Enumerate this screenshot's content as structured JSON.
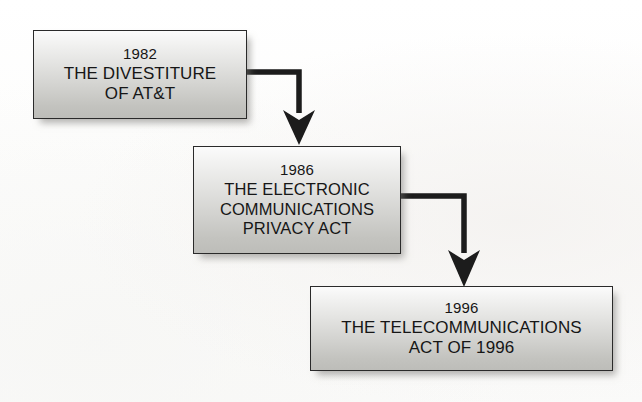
{
  "diagram": {
    "type": "flowchart",
    "orientation": "top-left to bottom-right cascade",
    "background_color": "#ffffff",
    "node_fill_top": "#fbfbfb",
    "node_fill_bottom": "#bdbdb9",
    "node_border_color": "#2a2a2a",
    "connector_color": "#1b1b1b",
    "nodes": [
      {
        "id": "node-1",
        "name": "divestiture-of-att",
        "year": "1982",
        "lines": [
          "THE DIVESTITURE",
          "OF AT&T"
        ]
      },
      {
        "id": "node-2",
        "name": "electronic-communications-privacy-act",
        "year": "1986",
        "lines": [
          "THE ELECTRONIC",
          "COMMUNICATIONS",
          "PRIVACY ACT"
        ]
      },
      {
        "id": "node-3",
        "name": "telecommunications-act-of-1996",
        "year": "1996",
        "lines": [
          "THE TELECOMMUNICATIONS",
          "ACT OF 1996"
        ]
      }
    ],
    "connectors": [
      {
        "name": "arrow-1982-to-1986",
        "from": "node-1",
        "to": "node-2",
        "style": "elbow-right-then-down"
      },
      {
        "name": "arrow-1986-to-1996",
        "from": "node-2",
        "to": "node-3",
        "style": "elbow-right-then-down"
      }
    ]
  }
}
